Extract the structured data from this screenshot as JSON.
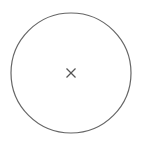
{
  "diagram": {
    "circle": {
      "cx": 71,
      "cy": 73,
      "r": 60,
      "stroke": "#666666",
      "stroke_width": 1.2,
      "fill": "#ffffff"
    },
    "center_mark": {
      "type": "x-mark",
      "cx": 71,
      "cy": 73,
      "half_size": 4.5,
      "stroke": "#555555",
      "stroke_width": 1.2
    }
  }
}
